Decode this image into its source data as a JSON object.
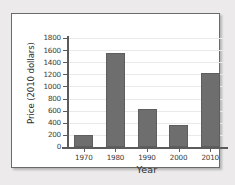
{
  "chart_data": {
    "type": "bar",
    "title": "",
    "xlabel": "Year",
    "ylabel": "Price (2010 dollars)",
    "categories": [
      "1970",
      "1980",
      "1990",
      "2000",
      "2010"
    ],
    "values": [
      200,
      1550,
      630,
      360,
      1230
    ],
    "ylim": [
      0,
      1800
    ],
    "ytick_step": 200,
    "yticks": [
      0,
      200,
      400,
      600,
      800,
      1000,
      1200,
      1400,
      1600,
      1800
    ],
    "ytick_labels": [
      "0",
      "200",
      "400",
      "600",
      "800",
      "1000",
      "1200",
      "1400",
      "1600",
      "1800"
    ],
    "grid": true,
    "grid_axis": "y",
    "legend": false,
    "series": [
      {
        "name": "Price",
        "values": [
          200,
          1550,
          630,
          360,
          1230
        ]
      }
    ]
  },
  "colors": {
    "bar_fill": "#6e6e6e",
    "bar_edge": "#5e5e5e",
    "axis": "#5b5b5b",
    "gridline": "#e9e9e9",
    "plot_background": "#ffffff",
    "frame_border": "#6a6a6a",
    "page_background": "#eceaea",
    "text": "#3a3a3a"
  }
}
